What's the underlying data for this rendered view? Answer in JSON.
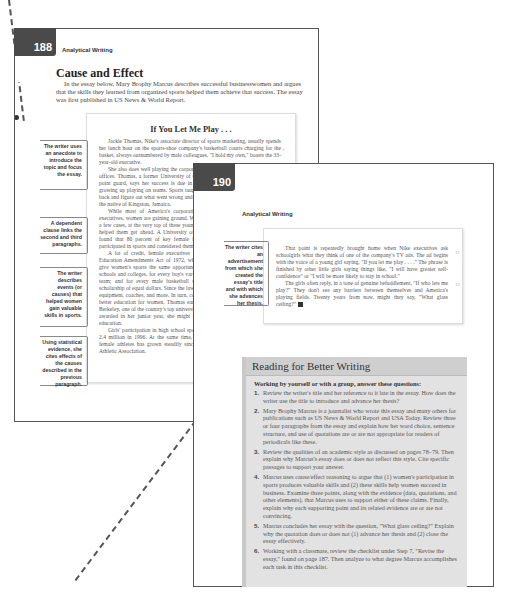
{
  "page1": {
    "page_number": "188",
    "running_head": "Analytical Writing",
    "section_title": "Cause and Effect",
    "intro": "In the essay below, Mary Brophy Marcus describes successful businesswomen and argues that the skills they learned from organized sports helped them achieve that success. The essay was first published in US News & World Report.",
    "essay_title": "If You Let Me Play . . .",
    "essay_paragraphs": [
      "Jackie Thomas, Nike's associate director of sports marketing, usually spends her lunch hour on the sports-shoe company's basketball courts charging for the basket, always outnumbered by male colleagues. \"I hold my own,\" boasts the 33-year-old executive.",
      "She also does well playing the corporate game back inside the headquarter's offices. Thomas, a former University of California–Berkeley college basketball point guard, says her success is due in large part to the lessons she learned growing up playing on teams. Sports taught me that if you lose a game, you go back and figure out what went wrong and how to overcome it the next time, says the native of Kingston, Jamaica.",
      "While most of America's corporations are still headed by male chief executives, women are gaining ground. Women in top management slots and, in a few cases, at the very top of these young female executives say playing sports helped them get ahead. A University of Virginia study of female executives found that 80 percent of key female leaders from Fortune 500 companies participated in sports and considered themselves tomboys.",
      "A lot of credit, female executives say, goes to Title IX of the Federal Education Amendments Act of 1972, which requires federally funded schools give women's sports the same opportunities men receive. That meant that in schools and colleges, for every boy's varsity soccer team, there must be a girls' team; and for every male basketball scholarship, there must be a female scholarship of equal dollars. Since the law passed, there has been money for new equipment, coaches, and more. In turn, college scholarships have translated into better education for women. Thomas earned a partial academic scholarship to Berkeley, one of the country's top universities; without the basketball scholarship awarded in her junior year, she might have had a hard time paying for the education.",
      "Girls' participation in high school sports has gone from 294,000 in 1971 to 2.4 million in 1996. At the same time, and possibly tougher, the number of female athletes has grown steadily since 1982, says the National Collegiate Athletic Association."
    ],
    "margin_numbers": [
      "1",
      "2"
    ],
    "annotations": [
      "The writer uses an anecdote to introduce the topic and focus the essay.",
      "A dependent clause links the second and third paragraphs.",
      "The writer describes events (or causes) that helped women gain valuable skills in sports.",
      "Using statistical evidence, she cites effects of the causes described in the previous paragraph."
    ]
  },
  "page2": {
    "page_number": "190",
    "running_head": "Analytical Writing",
    "annotation": "The writer cites an advertisement from which she created the essay's title and with which she advances her thesis.",
    "margin_numbers": [
      "11",
      "12"
    ],
    "essay_paragraphs": [
      "That point is repeatedly brought home when Nike executives ask schoolgirls what they think of one of the company's TV ads. The ad begins with the voice of a young girl saying, \"If you let me play . . . .\" The phrase is finished by other little girls saying things like, \"I will have greater self-confidence\" or \"I will be more likely to stay in school.\"",
      "The girls often reply, in a tone of genuine befuddlement, \"If who lets me play?\" They don't see any barriers between themselves and America's playing fields. Twenty years from now, might they say, \"What glass ceiling?\""
    ]
  },
  "reading_box": {
    "title": "Reading for Better Writing",
    "subtitle": "Working by yourself or with a group, answer these questions:",
    "items": [
      {
        "num": "1.",
        "text": "Review the writer's title and her reference to it late in the essay. How does the writer use the title to introduce and advance her thesis?"
      },
      {
        "num": "2.",
        "text": "Mary Brophy Marcus is a journalist who wrote this essay and many others for publications such as US News & World Report and USA Today. Review three or four paragraphs from the essay and explain how her word choice, sentence structure, and use of quotations are or are not appropriate for readers of periodicals like these."
      },
      {
        "num": "3.",
        "text": "Review the qualities of an academic style as discussed on pages 78–79. Then explain why Marcus's essay does or does not reflect this style. Cite specific passages to support your answer."
      },
      {
        "num": "4.",
        "text": "Marcus uses cause/effect reasoning to argue that (1) women's participation in sports produces valuable skills and (2) these skills help women succeed in business. Examine three points, along with the evidence (data, quotations, and other elements), that Marcus uses to support either of these claims. Finally, explain why each supporting point and its related evidence are or are not convincing."
      },
      {
        "num": "5.",
        "text": "Marcus concludes her essay with the question, \"What glass ceiling?\" Explain why the quotation does or does not (1) advance her thesis and (2) close the essay effectively."
      },
      {
        "num": "6.",
        "text": "Working with a classmate, review the checklist under Step 7, \"Revise the essay,\" found on page 187. Then analyze to what degree Marcus accomplishes each task in this checklist."
      }
    ]
  },
  "colors": {
    "badge": "#4a4a4a",
    "reading_header": "#cfcfcf",
    "reading_body": "#e2e2e2",
    "border": "#555555"
  }
}
